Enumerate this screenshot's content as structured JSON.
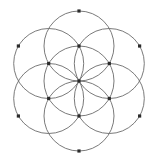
{
  "figure": {
    "name": "Seed of Life",
    "alt_name": "Flower of Life sacred geometry pattern",
    "canvas": {
      "width": 162,
      "height": 163,
      "background_color": "#ffffff"
    },
    "style": {
      "stroke_color": "#6b6b6b",
      "stroke_width": 0.9,
      "vertex_color": "#2b2b2b",
      "vertex_size": 3.2,
      "fill": "none"
    },
    "geometry": {
      "center": {
        "cx": 79,
        "cy": 81
      },
      "circle_radius": 35,
      "circle_count": 7,
      "vertex_count": 13,
      "inner_ring_radius": 35,
      "outer_ring_radius": 70,
      "angular_step_deg": 60
    },
    "circles": [
      {
        "id": "circle-center",
        "cx": 79,
        "cy": 81,
        "r": 35
      },
      {
        "id": "circle-n",
        "cx": 79,
        "cy": 46,
        "r": 35
      },
      {
        "id": "circle-ne",
        "cx": 109.31,
        "cy": 63.5,
        "r": 35
      },
      {
        "id": "circle-se",
        "cx": 109.31,
        "cy": 98.5,
        "r": 35
      },
      {
        "id": "circle-s",
        "cx": 79,
        "cy": 116,
        "r": 35
      },
      {
        "id": "circle-sw",
        "cx": 48.69,
        "cy": 98.5,
        "r": 35
      },
      {
        "id": "circle-nw",
        "cx": 48.69,
        "cy": 63.5,
        "r": 35
      }
    ],
    "vertices": [
      {
        "id": "vertex-center",
        "cx": 79,
        "cy": 81
      },
      {
        "id": "vertex-inner-n",
        "cx": 79,
        "cy": 46
      },
      {
        "id": "vertex-inner-ne",
        "cx": 109.31,
        "cy": 63.5
      },
      {
        "id": "vertex-inner-se",
        "cx": 109.31,
        "cy": 98.5
      },
      {
        "id": "vertex-inner-s",
        "cx": 79,
        "cy": 116
      },
      {
        "id": "vertex-inner-sw",
        "cx": 48.69,
        "cy": 98.5
      },
      {
        "id": "vertex-inner-nw",
        "cx": 48.69,
        "cy": 63.5
      },
      {
        "id": "vertex-outer-n",
        "cx": 79,
        "cy": 11
      },
      {
        "id": "vertex-outer-ne",
        "cx": 139.62,
        "cy": 46
      },
      {
        "id": "vertex-outer-se",
        "cx": 139.62,
        "cy": 116
      },
      {
        "id": "vertex-outer-s",
        "cx": 79,
        "cy": 151
      },
      {
        "id": "vertex-outer-sw",
        "cx": 18.38,
        "cy": 116
      },
      {
        "id": "vertex-outer-nw",
        "cx": 18.38,
        "cy": 46
      }
    ]
  }
}
